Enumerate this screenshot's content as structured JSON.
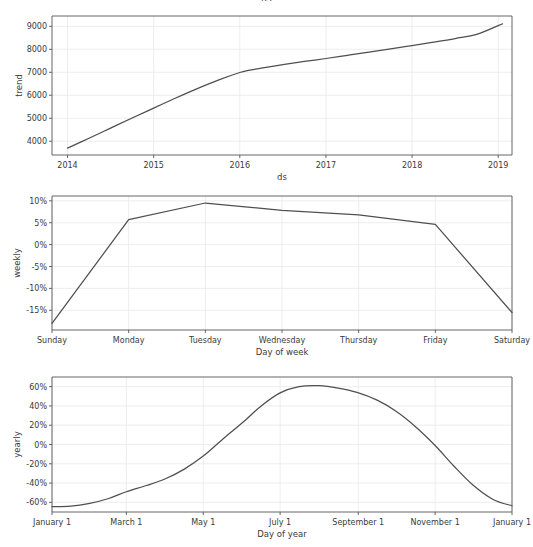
{
  "figure": {
    "width": 533,
    "height": 547,
    "background": "#ffffff",
    "line_color": "#4f4f4f",
    "axis_color": "#555555",
    "grid_color": "#e8e8e8",
    "tick_text_color": "#3a3a3a",
    "title_clipped": "ds"
  },
  "chart_data": [
    {
      "type": "line",
      "name": "trend",
      "title": "",
      "xlabel": "ds",
      "ylabel": "trend",
      "grid": true,
      "legend": "none",
      "xticklabels": [
        "2014",
        "2015",
        "2016",
        "2017",
        "2018",
        "2019"
      ],
      "yticklabels": [
        "4000",
        "5000",
        "6000",
        "7000",
        "8000",
        "9000"
      ],
      "xlim": [
        2013.82,
        2019.16
      ],
      "ylim": [
        3400,
        9450
      ],
      "x": [
        2014.0,
        2014.25,
        2014.5,
        2014.75,
        2015.0,
        2015.25,
        2015.5,
        2015.75,
        2016.0,
        2016.1,
        2016.25,
        2016.5,
        2016.75,
        2017.0,
        2017.25,
        2017.5,
        2017.75,
        2018.0,
        2018.25,
        2018.5,
        2018.75,
        2019.0,
        2019.05
      ],
      "values": [
        3700,
        4130,
        4570,
        5010,
        5440,
        5870,
        6280,
        6660,
        6990,
        7080,
        7180,
        7330,
        7470,
        7600,
        7740,
        7880,
        8020,
        8160,
        8310,
        8470,
        8650,
        9030,
        9110
      ]
    },
    {
      "type": "line",
      "name": "weekly",
      "title": "",
      "xlabel": "Day of week",
      "ylabel": "weekly",
      "grid": true,
      "legend": "none",
      "categories": [
        "Sunday",
        "Monday",
        "Tuesday",
        "Wednesday",
        "Thursday",
        "Friday",
        "Saturday"
      ],
      "xticklabels": [
        "Sunday",
        "Monday",
        "Tuesday",
        "Wednesday",
        "Thursday",
        "Friday",
        "Saturday"
      ],
      "yticklabels": [
        "-15%",
        "-10%",
        "-5%",
        "0%",
        "5%",
        "10%"
      ],
      "ylim": [
        -0.195,
        0.111
      ],
      "values": [
        -0.18,
        0.057,
        0.095,
        0.078,
        0.068,
        0.046,
        -0.155
      ]
    },
    {
      "type": "line",
      "name": "yearly",
      "title": "",
      "xlabel": "Day of year",
      "ylabel": "yearly",
      "grid": true,
      "legend": "none",
      "xticklabels": [
        "January 1",
        "March 1",
        "May 1",
        "July 1",
        "September 1",
        "November 1",
        "January 1"
      ],
      "yticklabels": [
        "-60%",
        "-40%",
        "-20%",
        "0%",
        "20%",
        "40%",
        "60%"
      ],
      "xlim": [
        0,
        365
      ],
      "ylim": [
        -0.7,
        0.7
      ],
      "x": [
        0,
        15,
        30,
        45,
        59,
        75,
        90,
        105,
        120,
        135,
        151,
        166,
        181,
        196,
        212,
        227,
        242,
        258,
        273,
        288,
        304,
        319,
        334,
        350,
        365
      ],
      "values": [
        -0.645,
        -0.64,
        -0.61,
        -0.56,
        -0.49,
        -0.425,
        -0.355,
        -0.255,
        -0.12,
        0.05,
        0.225,
        0.4,
        0.535,
        0.6,
        0.61,
        0.585,
        0.54,
        0.46,
        0.345,
        0.19,
        -0.01,
        -0.225,
        -0.42,
        -0.57,
        -0.635
      ]
    }
  ]
}
